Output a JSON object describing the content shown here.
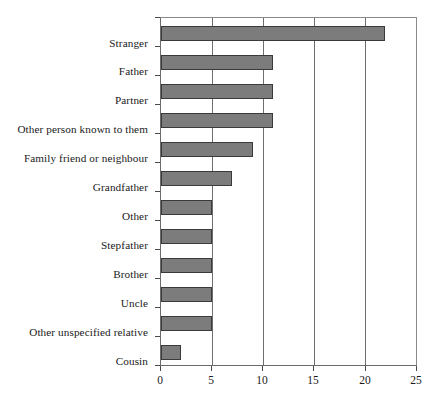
{
  "chart_data": {
    "type": "bar",
    "orientation": "horizontal",
    "title": "",
    "subtitle": "",
    "xlabel": "",
    "ylabel": "",
    "categories": [
      "Stranger",
      "Father",
      "Partner",
      "Other person known to them",
      "Family friend or neighbour",
      "Grandfather",
      "Other",
      "Stepfather",
      "Brother",
      "Uncle",
      "Other unspecified relative",
      "Cousin"
    ],
    "values": [
      22,
      11,
      11,
      11,
      9,
      7,
      5,
      5,
      5,
      5,
      5,
      2
    ],
    "xlim": [
      0,
      25
    ],
    "xticks": [
      0,
      5,
      10,
      15,
      20,
      25
    ],
    "xtick_labels": [
      "0",
      "5",
      "10",
      "15",
      "20",
      "25"
    ],
    "grid": "vertical",
    "legend": "none",
    "bar_fill_color": "#7c7c7c",
    "bar_border_color": "#3a3a3a",
    "axis_color": "#6b6b6b",
    "gridline_color": "#6e6e6e",
    "background_color": "#ffffff",
    "annotations": []
  }
}
